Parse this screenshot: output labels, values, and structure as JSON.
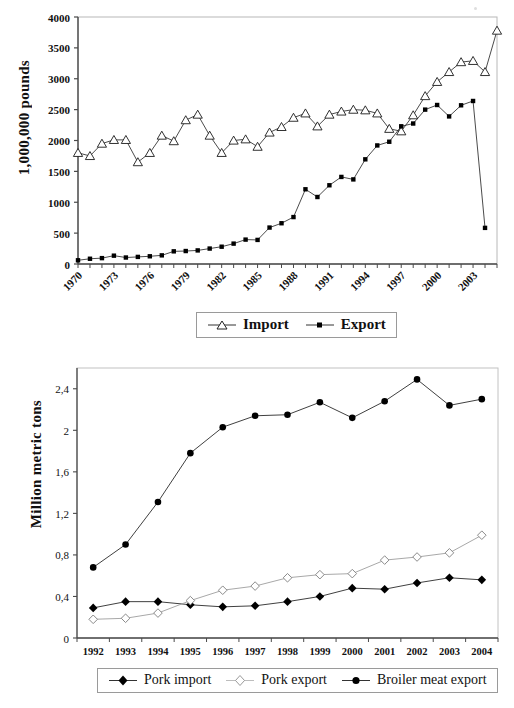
{
  "figure_top": {
    "ylabel": "1,000,000 pounds",
    "legend": [
      {
        "label": "Import",
        "marker": "open-triangle"
      },
      {
        "label": "Export",
        "marker": "filled-square"
      }
    ]
  },
  "figure_bottom": {
    "ylabel": "Million metric tons",
    "legend": [
      {
        "label": "Pork import",
        "marker": "filled-diamond"
      },
      {
        "label": "Pork export",
        "marker": "open-diamond"
      },
      {
        "label": "Broiler meat export",
        "marker": "filled-circle"
      }
    ]
  },
  "footnote": "partial cut-off text",
  "chart_data": [
    {
      "type": "line",
      "title": "",
      "xlabel": "",
      "ylabel": "1,000,000 pounds",
      "ylim": [
        0,
        4000
      ],
      "ytick_labels": [
        "0",
        "500",
        "1000",
        "1500",
        "2000",
        "2500",
        "3000",
        "3500",
        "4000"
      ],
      "ytick_values": [
        0,
        500,
        1000,
        1500,
        2000,
        2500,
        3000,
        3500,
        4000
      ],
      "grid": false,
      "legend_position": "bottom",
      "x": [
        1970,
        1971,
        1972,
        1973,
        1974,
        1975,
        1976,
        1977,
        1978,
        1979,
        1980,
        1981,
        1982,
        1983,
        1984,
        1985,
        1986,
        1987,
        1988,
        1989,
        1990,
        1991,
        1992,
        1993,
        1994,
        1995,
        1996,
        1997,
        1998,
        1999,
        2000,
        2001,
        2002,
        2003,
        2004,
        2005
      ],
      "xtick_labels": [
        "1970",
        "1973",
        "1976",
        "1979",
        "1982",
        "1985",
        "1988",
        "1991",
        "1994",
        "1997",
        "2000",
        "2003"
      ],
      "xtick_values": [
        1970,
        1973,
        1976,
        1979,
        1982,
        1985,
        1988,
        1991,
        1994,
        1997,
        2000,
        2003
      ],
      "series": [
        {
          "name": "Import",
          "marker": "open-triangle",
          "values": [
            1800,
            1750,
            1950,
            2010,
            2010,
            1650,
            1800,
            2080,
            1990,
            2330,
            2420,
            2080,
            1800,
            2000,
            2020,
            1900,
            2130,
            2220,
            2370,
            2440,
            2230,
            2420,
            2470,
            2500,
            2490,
            2440,
            2190,
            2150,
            2410,
            2720,
            2950,
            3110,
            3270,
            3290,
            3110,
            3780
          ]
        },
        {
          "name": "Export",
          "marker": "filled-square",
          "values": [
            60,
            85,
            95,
            135,
            105,
            115,
            125,
            140,
            205,
            210,
            220,
            250,
            280,
            330,
            395,
            390,
            590,
            660,
            760,
            1210,
            1085,
            1275,
            1410,
            1370,
            1695,
            1920,
            1980,
            2230,
            2275,
            2500,
            2575,
            2390,
            2570,
            2640,
            585,
            null
          ]
        }
      ]
    },
    {
      "type": "line",
      "title": "",
      "xlabel": "",
      "ylabel": "Million metric tons",
      "ylim": [
        0,
        2.6
      ],
      "ytick_labels": [
        "0",
        "0,4",
        "0,8",
        "1,2",
        "1,6",
        "2",
        "2,4"
      ],
      "ytick_values": [
        0,
        0.4,
        0.8,
        1.2,
        1.6,
        2.0,
        2.4
      ],
      "grid": false,
      "legend_position": "bottom",
      "categories": [
        1992,
        1993,
        1994,
        1995,
        1996,
        1997,
        1998,
        1999,
        2000,
        2001,
        2002,
        2003,
        2004
      ],
      "xtick_labels": [
        "1992",
        "1993",
        "1994",
        "1995",
        "1996",
        "1997",
        "1998",
        "1999",
        "2000",
        "2001",
        "2002",
        "2003",
        "2004"
      ],
      "series": [
        {
          "name": "Pork import",
          "marker": "filled-diamond",
          "values": [
            0.29,
            0.35,
            0.35,
            0.32,
            0.3,
            0.31,
            0.35,
            0.4,
            0.48,
            0.47,
            0.53,
            0.58,
            0.56
          ]
        },
        {
          "name": "Pork export",
          "marker": "open-diamond",
          "values": [
            0.18,
            0.19,
            0.24,
            0.36,
            0.46,
            0.5,
            0.58,
            0.61,
            0.62,
            0.75,
            0.78,
            0.82,
            0.99
          ]
        },
        {
          "name": "Broiler meat export",
          "marker": "filled-circle",
          "values": [
            0.68,
            0.9,
            1.31,
            1.78,
            2.03,
            2.14,
            2.15,
            2.27,
            2.12,
            2.28,
            2.49,
            2.24,
            2.3
          ]
        }
      ]
    }
  ]
}
